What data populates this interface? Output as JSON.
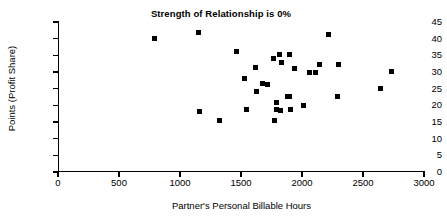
{
  "chart_data": {
    "type": "scatter",
    "title": "Strength of Relationship is 0%",
    "xlabel": "Partner's Personal Billable Hours",
    "ylabel": "Points (Profit Share)",
    "xlim": [
      0,
      3000
    ],
    "ylim": [
      0,
      45
    ],
    "xticks": [
      0,
      500,
      1000,
      1500,
      2000,
      2500,
      3000
    ],
    "yticks": [
      0,
      5,
      10,
      15,
      20,
      25,
      30,
      35,
      40,
      45
    ],
    "grid": false,
    "legend": null,
    "marker": "square",
    "marker_color": "#000000",
    "points": [
      {
        "x": 790,
        "y": 40.0
      },
      {
        "x": 1150,
        "y": 42.0
      },
      {
        "x": 1160,
        "y": 18.1
      },
      {
        "x": 1320,
        "y": 15.4
      },
      {
        "x": 1465,
        "y": 36.1
      },
      {
        "x": 1530,
        "y": 28.1
      },
      {
        "x": 1545,
        "y": 18.9
      },
      {
        "x": 1620,
        "y": 31.3
      },
      {
        "x": 1625,
        "y": 24.1
      },
      {
        "x": 1680,
        "y": 26.5
      },
      {
        "x": 1720,
        "y": 26.4
      },
      {
        "x": 1770,
        "y": 34.2
      },
      {
        "x": 1775,
        "y": 15.4
      },
      {
        "x": 1790,
        "y": 20.8
      },
      {
        "x": 1795,
        "y": 18.7
      },
      {
        "x": 1815,
        "y": 35.3
      },
      {
        "x": 1820,
        "y": 18.6
      },
      {
        "x": 1830,
        "y": 32.8
      },
      {
        "x": 1885,
        "y": 22.7
      },
      {
        "x": 1895,
        "y": 22.7
      },
      {
        "x": 1900,
        "y": 35.2
      },
      {
        "x": 1905,
        "y": 18.9
      },
      {
        "x": 1935,
        "y": 31.1
      },
      {
        "x": 2015,
        "y": 20.0
      },
      {
        "x": 2060,
        "y": 30.0
      },
      {
        "x": 2110,
        "y": 30.0
      },
      {
        "x": 2145,
        "y": 32.3
      },
      {
        "x": 2215,
        "y": 41.2
      },
      {
        "x": 2290,
        "y": 22.8
      },
      {
        "x": 2300,
        "y": 32.4
      },
      {
        "x": 2640,
        "y": 25.2
      },
      {
        "x": 2730,
        "y": 30.3
      }
    ]
  }
}
